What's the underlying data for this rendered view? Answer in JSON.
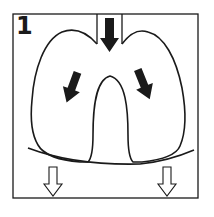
{
  "diagram": {
    "step_number": "1",
    "colors": {
      "stroke": "#1a1a1a",
      "background": "#ffffff"
    },
    "elements": {
      "trachea_arrow": "down",
      "left_lung_arrow": "down-left",
      "right_lung_arrow": "down-right",
      "diaphragm_left_arrow": "down-outline",
      "diaphragm_right_arrow": "down-outline"
    }
  }
}
